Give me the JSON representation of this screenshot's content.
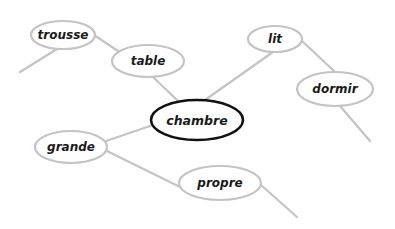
{
  "diagram": {
    "type": "word-web",
    "center": {
      "id": "chambre",
      "label": "chambre",
      "cx": 197,
      "cy": 120,
      "rx": 46,
      "ry": 20
    },
    "colors": {
      "background": "#ffffff",
      "center_stroke": "#111111",
      "node_stroke": "#c4c4c4",
      "edge": "#c4c4c4",
      "text": "#1a1a1a"
    },
    "nodes": [
      {
        "id": "trousse",
        "label": "trousse",
        "cx": 63,
        "cy": 35,
        "rx": 32,
        "ry": 14
      },
      {
        "id": "table",
        "label": "table",
        "cx": 148,
        "cy": 61,
        "rx": 36,
        "ry": 16
      },
      {
        "id": "lit",
        "label": "lit",
        "cx": 275,
        "cy": 39,
        "rx": 27,
        "ry": 13
      },
      {
        "id": "dormir",
        "label": "dormir",
        "cx": 335,
        "cy": 89,
        "rx": 38,
        "ry": 17
      },
      {
        "id": "grande",
        "label": "grande",
        "cx": 71,
        "cy": 147,
        "rx": 36,
        "ry": 16
      },
      {
        "id": "propre",
        "label": "propre",
        "cx": 220,
        "cy": 183,
        "rx": 41,
        "ry": 17
      }
    ],
    "edges": [
      {
        "from": "trousse",
        "to": "stub",
        "x1": 57,
        "y1": 49,
        "x2": 20,
        "y2": 72
      },
      {
        "from": "trousse",
        "to": "table",
        "x1": 94,
        "y1": 35,
        "x2": 118,
        "y2": 51
      },
      {
        "from": "table",
        "to": "chambre",
        "x1": 153,
        "y1": 77,
        "x2": 178,
        "y2": 101
      },
      {
        "from": "lit",
        "to": "chambre",
        "x1": 273,
        "y1": 52,
        "x2": 205,
        "y2": 100
      },
      {
        "from": "lit",
        "to": "dormir",
        "x1": 301,
        "y1": 40,
        "x2": 335,
        "y2": 72
      },
      {
        "from": "dormir",
        "to": "stub",
        "x1": 340,
        "y1": 106,
        "x2": 370,
        "y2": 141
      },
      {
        "from": "grande",
        "to": "chambre",
        "x1": 106,
        "y1": 141,
        "x2": 153,
        "y2": 125
      },
      {
        "from": "grande",
        "to": "propre",
        "x1": 107,
        "y1": 151,
        "x2": 180,
        "y2": 187
      },
      {
        "from": "propre",
        "to": "stub",
        "x1": 261,
        "y1": 185,
        "x2": 297,
        "y2": 217
      }
    ]
  }
}
